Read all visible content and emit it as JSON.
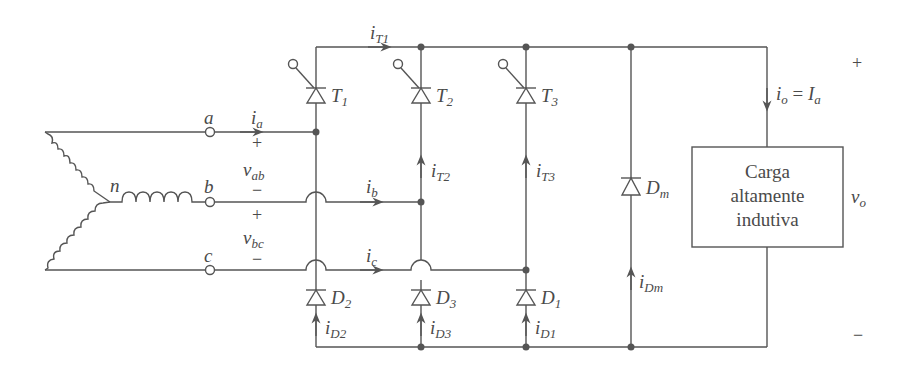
{
  "diagram": {
    "type": "three-phase semi-converter (half-controlled bridge) with freewheeling diode",
    "source": {
      "neutral_label": "n",
      "phases": [
        {
          "terminal": "a",
          "current": "i",
          "current_sub": "a"
        },
        {
          "terminal": "b",
          "current": "i",
          "current_sub": "b"
        },
        {
          "terminal": "c",
          "current": "i",
          "current_sub": "c"
        }
      ],
      "line_voltages": [
        {
          "name": "v",
          "sub": "ab",
          "plus": "+",
          "minus": "−"
        },
        {
          "name": "v",
          "sub": "bc",
          "plus": "+",
          "minus": "−"
        }
      ]
    },
    "thyristors": [
      {
        "label": "T",
        "sub": "1",
        "current": "i",
        "current_sub": "T1"
      },
      {
        "label": "T",
        "sub": "2",
        "current": "i",
        "current_sub": "T2"
      },
      {
        "label": "T",
        "sub": "3",
        "current": "i",
        "current_sub": "T3"
      }
    ],
    "diodes": [
      {
        "label": "D",
        "sub": "2",
        "current": "i",
        "current_sub": "D2"
      },
      {
        "label": "D",
        "sub": "3",
        "current": "i",
        "current_sub": "D3"
      },
      {
        "label": "D",
        "sub": "1",
        "current": "i",
        "current_sub": "D1"
      }
    ],
    "freewheeling_diode": {
      "label": "D",
      "sub": "m",
      "current": "i",
      "current_sub": "Dm"
    },
    "load": {
      "lines": [
        "Carga",
        "altamente",
        "indutiva"
      ],
      "current_label": "i",
      "current_sub": "o",
      "equals": " = ",
      "current_value": "I",
      "current_value_sub": "a",
      "voltage": "v",
      "voltage_sub": "o",
      "plus": "+",
      "minus": "−"
    },
    "colors": {
      "stroke": "#555555",
      "text": "#4a4a4a",
      "background": "#ffffff"
    }
  }
}
